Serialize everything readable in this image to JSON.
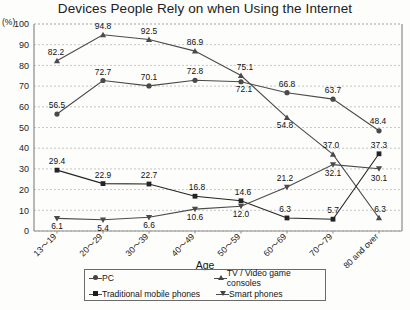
{
  "chart_data": {
    "type": "line",
    "title": "Devices People Rely on when Using the Internet",
    "xlabel": "Age",
    "ylabel": "",
    "yunit": "(%)",
    "ylim": [
      0,
      100
    ],
    "ytick_step": 10,
    "yticks": [
      "0",
      "10",
      "20",
      "30",
      "40",
      "50",
      "60",
      "70",
      "80",
      "90",
      "100"
    ],
    "grid": true,
    "legend_position": "bottom",
    "categories": [
      "13～19",
      "20～29",
      "30～39",
      "40～49",
      "50～59",
      "60～69",
      "70～79",
      "80 and over"
    ],
    "series": [
      {
        "name": "PC",
        "marker": "circle",
        "color": "#4a4a4a",
        "values": [
          56.5,
          72.7,
          70.1,
          72.8,
          72.1,
          66.8,
          63.7,
          48.4
        ],
        "labels": [
          "56.5",
          "72.7",
          "70.1",
          "72.8",
          "72.1",
          "66.8",
          "63.7",
          "48.4"
        ]
      },
      {
        "name": "TV / Video game consoles",
        "marker": "triangle-up",
        "color": "#4a4a4a",
        "values": [
          82.2,
          94.8,
          92.5,
          86.9,
          75.1,
          54.8,
          37.0,
          6.3
        ],
        "labels": [
          "82.2",
          "94.8",
          "92.5",
          "86.9",
          "75.1",
          "54.8",
          "37.0",
          "6.3"
        ]
      },
      {
        "name": "Traditional mobile phones",
        "marker": "square",
        "color": "#242424",
        "values": [
          29.4,
          22.9,
          22.7,
          16.8,
          14.6,
          6.3,
          5.7,
          37.3
        ],
        "labels": [
          "29.4",
          "22.9",
          "22.7",
          "16.8",
          "14.6",
          "6.3",
          "5.7",
          "37.3"
        ]
      },
      {
        "name": "Smart phones",
        "marker": "triangle-down",
        "color": "#4a4a4a",
        "values": [
          6.1,
          5.4,
          6.6,
          10.6,
          12.0,
          21.2,
          32.1,
          30.1
        ],
        "labels": [
          "6.1",
          "5.4",
          "6.6",
          "10.6",
          "12.0",
          "21.2",
          "32.1",
          "30.1"
        ]
      }
    ]
  },
  "legend": {
    "pc": "PC",
    "tv": "TV / Video game consoles",
    "traditional": "Traditional mobile phones",
    "smart": "Smart phones"
  }
}
